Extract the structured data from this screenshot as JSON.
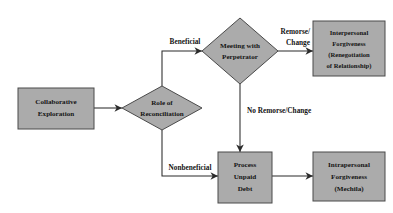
{
  "diagram": {
    "colors": {
      "node_fill": "#ababab",
      "node_stroke": "#4a4a4a",
      "edge": "#2b2b2b",
      "text": "#141414",
      "background": "#ffffff"
    },
    "nodes": [
      {
        "id": "collaborative-exploration",
        "shape": "rectangle",
        "lines": [
          "Collaborative",
          "Exploration"
        ]
      },
      {
        "id": "role-of-reconciliation",
        "shape": "diamond",
        "lines": [
          "Role of",
          "Reconciliation"
        ]
      },
      {
        "id": "meeting-with-perpetrator",
        "shape": "diamond",
        "lines": [
          "Meeting with",
          "Perpetrator"
        ]
      },
      {
        "id": "interpersonal-forgiveness",
        "shape": "rectangle",
        "lines": [
          "Interpersonal",
          "Forgiveness",
          "(Renegotiation",
          "of Relationship)"
        ]
      },
      {
        "id": "process-unpaid-debt",
        "shape": "rectangle",
        "lines": [
          "Process",
          "Unpaid",
          "Debt"
        ]
      },
      {
        "id": "intrapersonal-forgiveness",
        "shape": "rectangle",
        "lines": [
          "Intrapersonal",
          "Forgiveness",
          "(Mechila)"
        ]
      }
    ],
    "edges": [
      {
        "id": "exploration-to-reconciliation",
        "from": "collaborative-exploration",
        "to": "role-of-reconciliation",
        "label": ""
      },
      {
        "id": "beneficial",
        "from": "role-of-reconciliation",
        "to": "meeting-with-perpetrator",
        "label": "Beneficial"
      },
      {
        "id": "nonbeneficial",
        "from": "role-of-reconciliation",
        "to": "process-unpaid-debt",
        "label": "Nonbeneficial"
      },
      {
        "id": "remorse-change",
        "from": "meeting-with-perpetrator",
        "to": "interpersonal-forgiveness",
        "label_lines": [
          "Remorse/",
          "Change"
        ]
      },
      {
        "id": "no-remorse-change",
        "from": "meeting-with-perpetrator",
        "to": "process-unpaid-debt",
        "label": "No Remorse/Change"
      },
      {
        "id": "debt-to-intrapersonal",
        "from": "process-unpaid-debt",
        "to": "intrapersonal-forgiveness",
        "label": ""
      }
    ]
  },
  "labels": {
    "collaborative_1": "Collaborative",
    "collaborative_2": "Exploration",
    "reconciliation_1": "Role of",
    "reconciliation_2": "Reconciliation",
    "meeting_1": "Meeting with",
    "meeting_2": "Perpetrator",
    "interpersonal_1": "Interpersonal",
    "interpersonal_2": "Forgiveness",
    "interpersonal_3": "(Renegotiation",
    "interpersonal_4": "of Relationship)",
    "process_1": "Process",
    "process_2": "Unpaid",
    "process_3": "Debt",
    "intrapersonal_1": "Intrapersonal",
    "intrapersonal_2": "Forgiveness",
    "intrapersonal_3": "(Mechila)",
    "edge_beneficial": "Beneficial",
    "edge_nonbeneficial": "Nonbeneficial",
    "edge_remorse_1": "Remorse/",
    "edge_remorse_2": "Change",
    "edge_no_remorse": "No Remorse/Change"
  }
}
